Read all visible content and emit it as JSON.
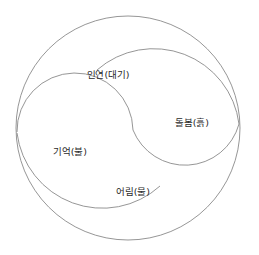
{
  "diagram": {
    "type": "spiral-quadrant-circle",
    "shape_name": "double-s-spiral",
    "background_color": "#ffffff",
    "stroke_color": "#8a8a8a",
    "stroke_width": 0.9,
    "text_color": "#2b2b2b",
    "circle": {
      "center_x": 128,
      "center_y": 128,
      "radius": 112
    },
    "labels": [
      {
        "id": "air",
        "text": "인연(대기)",
        "concept": "인연",
        "element": "대기",
        "x": 108,
        "y": 75
      },
      {
        "id": "earth",
        "text": "돌봄(흙)",
        "concept": "돌봄",
        "element": "흙",
        "x": 192,
        "y": 123
      },
      {
        "id": "fire",
        "text": "기억(불)",
        "concept": "기억",
        "element": "불",
        "x": 70,
        "y": 152
      },
      {
        "id": "water",
        "text": "어림(물)",
        "concept": "어림",
        "element": "물",
        "x": 133,
        "y": 192
      }
    ]
  }
}
